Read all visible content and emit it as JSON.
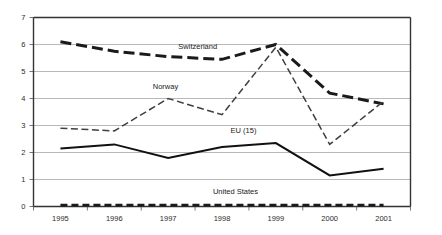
{
  "chart_data": {
    "type": "line",
    "title": "",
    "subtitle": "",
    "xlabel": "",
    "ylabel": "",
    "categories": [
      "1995",
      "1996",
      "1997",
      "1998",
      "1999",
      "2000",
      "2001"
    ],
    "x": [
      1995,
      1996,
      1997,
      1998,
      1999,
      2000,
      2001
    ],
    "ylim": [
      0,
      7
    ],
    "yticks": [
      "0",
      "1",
      "2",
      "3",
      "4",
      "5",
      "6",
      "7"
    ],
    "ytick_values": [
      0,
      1,
      2,
      3,
      4,
      5,
      6,
      7
    ],
    "grid": "horizontal",
    "legend_position": "inline-annotations",
    "series": [
      {
        "name": "Switzerland",
        "values": [
          6.1,
          5.75,
          5.55,
          5.45,
          6.0,
          4.2,
          3.8
        ],
        "style": "thick-dashed",
        "color": "#1a1a1a",
        "label_x": 1997.55,
        "label_y": 5.85
      },
      {
        "name": "Norway",
        "values": [
          2.9,
          2.8,
          4.0,
          3.4,
          5.9,
          2.3,
          3.9
        ],
        "style": "thin-dash-dot",
        "color": "#3f3f3f",
        "label_x": 1996.95,
        "label_y": 4.35
      },
      {
        "name": "EU (15)",
        "values": [
          2.15,
          2.3,
          1.8,
          2.2,
          2.35,
          1.15,
          1.4
        ],
        "style": "solid",
        "color": "#111111",
        "label_x": 1998.4,
        "label_y": 2.72
      },
      {
        "name": "United States",
        "values": [
          0.05,
          0.05,
          0.05,
          0.05,
          0.05,
          0.05,
          0.05
        ],
        "style": "thick-short-dashed",
        "color": "#1a1a1a",
        "label_x": 1998.25,
        "label_y": 0.45
      }
    ]
  }
}
